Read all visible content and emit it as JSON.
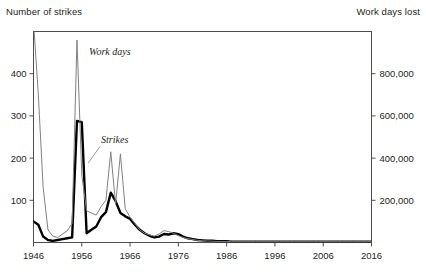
{
  "figure": {
    "left_axis_title": "Number of strikes",
    "right_axis_title": "Work days lost"
  },
  "chart_data": {
    "type": "line",
    "title": "",
    "subtitle": "",
    "xlabel": "",
    "ylabel": "Number of strikes",
    "y2label": "Work days lost",
    "grid": false,
    "legend": "inline-annotations",
    "xlim": [
      1946,
      2016
    ],
    "ylim": [
      0,
      500
    ],
    "y2lim": [
      0,
      1000000
    ],
    "xticks": [
      1946,
      1956,
      1966,
      1976,
      1986,
      1996,
      2006,
      2016
    ],
    "xticklabels": [
      "1946",
      "1956",
      "1966",
      "1976",
      "1986",
      "1996",
      "2006",
      "2016"
    ],
    "yticks": [
      100,
      200,
      300,
      400
    ],
    "yticklabels": [
      "100",
      "200",
      "300",
      "400"
    ],
    "y2ticks": [
      200000,
      400000,
      600000,
      800000
    ],
    "y2ticklabels": [
      "200,000",
      "400,000",
      "600,000",
      "800,000"
    ],
    "annotations": [
      {
        "text": "Work days",
        "x": 1957.5,
        "y": 445
      },
      {
        "text": "Strikes",
        "x": 1960.0,
        "y": 235
      }
    ],
    "series": [
      {
        "name": "Strikes",
        "axis": "left",
        "color": "#000000",
        "style": "thick-black",
        "x": [
          1946,
          1947,
          1948,
          1949,
          1950,
          1951,
          1952,
          1953,
          1954,
          1955,
          1956,
          1957,
          1958,
          1959,
          1960,
          1961,
          1962,
          1963,
          1964,
          1965,
          1966,
          1967,
          1968,
          1969,
          1970,
          1971,
          1972,
          1973,
          1974,
          1975,
          1976,
          1977,
          1978,
          1979,
          1980,
          1981,
          1982,
          1983,
          1984,
          1985,
          1986,
          1987,
          1988,
          1989,
          1990,
          1991,
          1992,
          1993,
          1994,
          1995,
          1996,
          1997,
          1998,
          1999,
          2000,
          2001,
          2002,
          2003,
          2004,
          2005,
          2006,
          2007,
          2008,
          2009,
          2010,
          2011,
          2012,
          2013,
          2014,
          2015,
          2016
        ],
        "values": [
          50,
          42,
          14,
          6,
          4,
          6,
          8,
          10,
          12,
          288,
          285,
          22,
          30,
          38,
          60,
          72,
          118,
          98,
          70,
          62,
          56,
          42,
          30,
          22,
          16,
          12,
          14,
          20,
          19,
          22,
          20,
          14,
          10,
          8,
          6,
          5,
          4,
          4,
          3,
          3,
          3,
          2,
          2,
          2,
          2,
          2,
          2,
          2,
          2,
          2,
          2,
          2,
          2,
          2,
          2,
          2,
          2,
          2,
          2,
          2,
          2,
          2,
          2,
          2,
          2,
          2,
          2,
          2,
          2,
          2,
          2
        ]
      },
      {
        "name": "Work days",
        "axis": "right",
        "color": "#808080",
        "style": "thin-gray",
        "x": [
          1946,
          1947,
          1948,
          1949,
          1950,
          1951,
          1952,
          1953,
          1954,
          1955,
          1956,
          1957,
          1958,
          1959,
          1960,
          1961,
          1962,
          1963,
          1964,
          1965,
          1966,
          1967,
          1968,
          1969,
          1970,
          1971,
          1972,
          1973,
          1974,
          1975,
          1976,
          1977,
          1978,
          1979,
          1980,
          1981,
          1982,
          1983,
          1984,
          1985,
          1986,
          1987,
          1988,
          1989,
          1990,
          1991,
          1992,
          1993,
          1994,
          1995,
          1996,
          1997,
          1998,
          1999,
          2000,
          2001,
          2002,
          2003,
          2004,
          2005,
          2006,
          2007,
          2008,
          2009,
          2010,
          2011,
          2012,
          2013,
          2014,
          2015,
          2016
        ],
        "values": [
          1050000,
          700000,
          260000,
          60000,
          30000,
          24000,
          40000,
          56000,
          90000,
          960000,
          320000,
          150000,
          140000,
          130000,
          170000,
          200000,
          430000,
          180000,
          420000,
          160000,
          120000,
          90000,
          60000,
          44000,
          36000,
          30000,
          40000,
          56000,
          52000,
          44000,
          32000,
          24000,
          18000,
          14000,
          10000,
          8000,
          7000,
          6000,
          5000,
          5000,
          5000,
          4000,
          4000,
          4000,
          4000,
          4000,
          4000,
          4000,
          4000,
          4000,
          4000,
          4000,
          4000,
          4000,
          4000,
          4000,
          4000,
          4000,
          4000,
          4000,
          4000,
          4000,
          4000,
          4000,
          4000,
          4000,
          4000,
          4000,
          4000,
          4000,
          4000
        ]
      }
    ]
  }
}
